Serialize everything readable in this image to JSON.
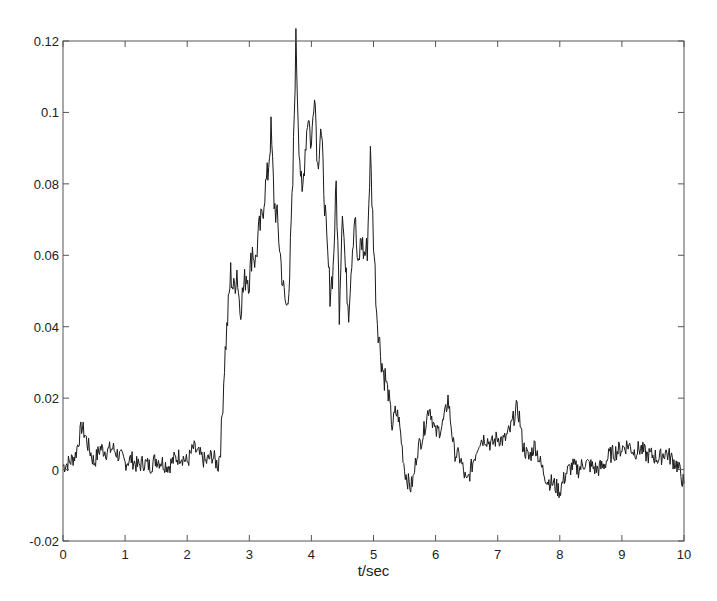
{
  "chart_data": {
    "type": "line",
    "title": "",
    "xlabel": "t/sec",
    "ylabel": "",
    "xlim": [
      0,
      10
    ],
    "ylim": [
      -0.02,
      0.12
    ],
    "grid": false,
    "legend": null,
    "xticks": [
      "0",
      "1",
      "2",
      "3",
      "4",
      "5",
      "6",
      "7",
      "8",
      "9",
      "10"
    ],
    "yticks": [
      "-0.02",
      "0",
      "0.02",
      "0.04",
      "0.06",
      "0.08",
      "0.1",
      "0.12"
    ],
    "series": [
      {
        "name": "signal",
        "color": "#1a1a1a",
        "x": [
          0,
          0.1,
          0.2,
          0.3,
          0.35,
          0.4,
          0.5,
          0.6,
          0.7,
          0.8,
          0.9,
          1.0,
          1.1,
          1.2,
          1.3,
          1.4,
          1.5,
          1.6,
          1.7,
          1.8,
          1.9,
          2.0,
          2.1,
          2.2,
          2.3,
          2.4,
          2.5,
          2.55,
          2.6,
          2.65,
          2.7,
          2.75,
          2.8,
          2.85,
          2.9,
          2.95,
          3.0,
          3.05,
          3.1,
          3.15,
          3.2,
          3.25,
          3.3,
          3.35,
          3.4,
          3.45,
          3.5,
          3.55,
          3.6,
          3.65,
          3.7,
          3.75,
          3.8,
          3.85,
          3.9,
          3.95,
          4.0,
          4.05,
          4.1,
          4.15,
          4.2,
          4.25,
          4.3,
          4.35,
          4.4,
          4.45,
          4.5,
          4.55,
          4.6,
          4.65,
          4.7,
          4.75,
          4.8,
          4.85,
          4.9,
          4.95,
          5.0,
          5.05,
          5.1,
          5.15,
          5.2,
          5.25,
          5.3,
          5.35,
          5.4,
          5.45,
          5.5,
          5.55,
          5.6,
          5.65,
          5.7,
          5.8,
          5.9,
          6.0,
          6.1,
          6.15,
          6.2,
          6.3,
          6.4,
          6.5,
          6.6,
          6.7,
          6.8,
          6.9,
          7.0,
          7.1,
          7.2,
          7.3,
          7.35,
          7.4,
          7.5,
          7.6,
          7.7,
          7.8,
          7.9,
          8.0,
          8.1,
          8.2,
          8.3,
          8.4,
          8.5,
          8.6,
          8.7,
          8.8,
          8.9,
          9.0,
          9.1,
          9.2,
          9.3,
          9.4,
          9.5,
          9.6,
          9.7,
          9.8,
          9.9,
          10.0
        ],
        "y": [
          0.001,
          0.002,
          0.004,
          0.012,
          0.01,
          0.007,
          0.002,
          0.006,
          0.005,
          0.006,
          0.004,
          0.002,
          0.003,
          0.001,
          0.002,
          0.001,
          0.003,
          0.002,
          0.001,
          0.003,
          0.004,
          0.002,
          0.006,
          0.004,
          0.002,
          0.004,
          0.001,
          0.01,
          0.03,
          0.042,
          0.055,
          0.05,
          0.056,
          0.045,
          0.05,
          0.055,
          0.053,
          0.062,
          0.058,
          0.066,
          0.07,
          0.078,
          0.083,
          0.095,
          0.075,
          0.07,
          0.06,
          0.05,
          0.045,
          0.055,
          0.08,
          0.12,
          0.092,
          0.075,
          0.09,
          0.1,
          0.09,
          0.108,
          0.085,
          0.096,
          0.08,
          0.062,
          0.05,
          0.056,
          0.08,
          0.045,
          0.075,
          0.055,
          0.045,
          0.06,
          0.072,
          0.055,
          0.065,
          0.06,
          0.062,
          0.088,
          0.065,
          0.045,
          0.035,
          0.028,
          0.025,
          0.02,
          0.012,
          0.016,
          0.015,
          0.008,
          0.0,
          -0.003,
          -0.005,
          -0.002,
          0.005,
          0.01,
          0.018,
          0.01,
          0.012,
          0.015,
          0.02,
          0.005,
          0.003,
          -0.004,
          0.002,
          0.008,
          0.009,
          0.007,
          0.009,
          0.008,
          0.011,
          0.017,
          0.015,
          0.007,
          0.003,
          0.007,
          0.001,
          -0.003,
          -0.004,
          -0.006,
          -0.001,
          0.001,
          0.0,
          0.002,
          0.001,
          0.0,
          0.001,
          0.004,
          0.005,
          0.006,
          0.007,
          0.005,
          0.006,
          0.004,
          0.004,
          0.003,
          0.005,
          0.003,
          0.001,
          -0.004
        ]
      }
    ]
  }
}
